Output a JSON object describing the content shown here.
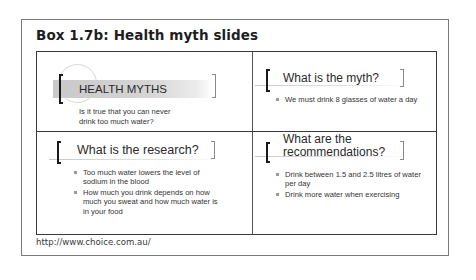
{
  "box": {
    "title": "Box 1.7b: Health myth slides",
    "source_url": "http://www.choice.com.au/"
  },
  "slides": [
    {
      "heading": "HEALTH MYTHS",
      "body": "Is it true that you can never drink too much water?",
      "body_lines": [
        "Is it true that you can never",
        "drink too much water?"
      ]
    },
    {
      "heading": "What is the myth?",
      "bullets": [
        "We must drink 8 glasses of water a day"
      ]
    },
    {
      "heading": "What is the research?",
      "bullets": [
        "Too much water lowers the level of sodium in the blood",
        "How much you drink depends on how much you sweat and how much water is in your food"
      ]
    },
    {
      "heading": "What are the recommendations?",
      "heading_lines": [
        "What are the",
        "recommendations?"
      ],
      "bullets": [
        "Drink between 1.5 and 2.5 litres of water per day",
        "Drink more water when exercising"
      ]
    }
  ],
  "colors": {
    "border": "#3a3a3a",
    "band": "#c9c9c9",
    "bracket_left": "#1a1a1a",
    "bracket_right": "#8a8a8a"
  }
}
